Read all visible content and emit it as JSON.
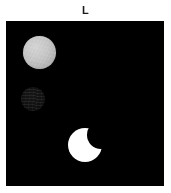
{
  "figure": {
    "panel_label": "L",
    "background_color": "#ffffff",
    "panel_background_color": "#000000",
    "panel_border_color": "#000000"
  },
  "objects": [
    {
      "id": "gray-disk",
      "description": "light gray disk",
      "shape": "circle",
      "color": "#c3c3c3",
      "brightness": "medium",
      "position": "upper-left",
      "center_x": 39,
      "center_y": 53,
      "diameter": 33
    },
    {
      "id": "dark-disk",
      "description": "very dark textured disk",
      "shape": "circle",
      "color": "#0c0c0c",
      "brightness": "very-low",
      "position": "middle-left",
      "center_x": 33,
      "center_y": 99,
      "diameter": 24
    },
    {
      "id": "white-disk",
      "description": "bright white disk with circular notch cut from upper right",
      "shape": "occulted-circle",
      "color": "#ffffff",
      "brightness": "high",
      "position": "lower-center",
      "center_x": 85,
      "center_y": 145,
      "diameter": 34,
      "notch_diameter": 28
    }
  ]
}
